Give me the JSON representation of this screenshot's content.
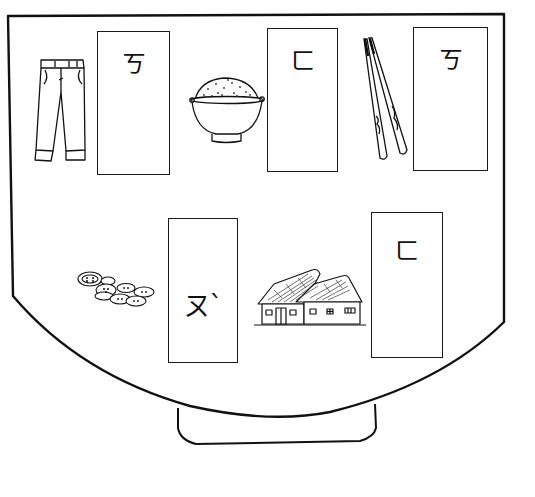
{
  "worksheet": {
    "colors": {
      "ink": "#111111",
      "paper": "#ffffff"
    },
    "cards": [
      {
        "id": "card-1",
        "symbol": "ㄎ",
        "pairs_with": "pants",
        "x": 97,
        "y": 31,
        "w": 73,
        "h": 144,
        "glyph_top": 20
      },
      {
        "id": "card-2",
        "symbol": "ㄈ",
        "pairs_with": "rice-bowl",
        "x": 267,
        "y": 28,
        "w": 71,
        "h": 144,
        "glyph_top": 20
      },
      {
        "id": "card-3",
        "symbol": "ㄎ",
        "pairs_with": "chopsticks",
        "x": 413,
        "y": 27,
        "w": 75,
        "h": 144,
        "glyph_top": 20
      },
      {
        "id": "card-4",
        "symbol": "ㄡˋ",
        "pairs_with": "buttons",
        "x": 168,
        "y": 218,
        "w": 70,
        "h": 145,
        "glyph_top": 74
      },
      {
        "id": "card-5",
        "symbol": "ㄈ",
        "pairs_with": "house",
        "x": 371,
        "y": 212,
        "w": 72,
        "h": 146,
        "glyph_top": 26
      }
    ],
    "pictures": [
      {
        "id": "pants",
        "label": "pants"
      },
      {
        "id": "rice-bowl",
        "label": "bowl of rice"
      },
      {
        "id": "chopsticks",
        "label": "chopsticks"
      },
      {
        "id": "buttons",
        "label": "buttons"
      },
      {
        "id": "house",
        "label": "house"
      }
    ]
  }
}
